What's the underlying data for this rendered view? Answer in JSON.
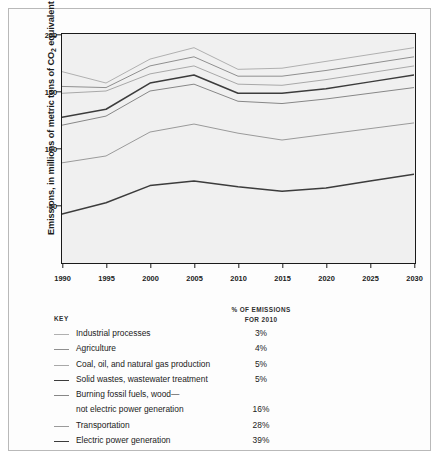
{
  "chart_data": {
    "type": "line",
    "title": "",
    "xlabel": "",
    "ylabel": "Emissions, in millions of metric tons of CO2 equivalent",
    "ylabel_prefix": "Emissions, in millions of metric tons of CO",
    "ylabel_sub": "2",
    "ylabel_suffix": " equivalent",
    "x": [
      1990,
      1995,
      2000,
      2005,
      2010,
      2015,
      2020,
      2025,
      2030
    ],
    "xticklabels": [
      "1990",
      "1995",
      "2000",
      "2005",
      "2010",
      "2015",
      "2020",
      "2025",
      "2030"
    ],
    "yticklabels": [
      "200",
      "150",
      "100",
      "50"
    ],
    "ytickvalues": [
      200,
      150,
      100,
      50
    ],
    "xlim": [
      1990,
      2030
    ],
    "ylim": [
      0,
      200
    ],
    "grid": false,
    "legend_position": "below",
    "note": "Cumulative stacked boundary lines; each series value is the running total including all sources below it.",
    "series": [
      {
        "name": "Electric power generation",
        "cumulative": [
          42,
          52,
          67,
          71,
          66,
          62,
          65,
          71,
          77
        ],
        "color": "#3c3c3c",
        "width": 1.5
      },
      {
        "name": "Transportation",
        "cumulative": [
          87,
          93,
          114,
          121,
          113,
          107,
          112,
          117,
          122
        ],
        "color": "#9a9a9a",
        "width": 1.0
      },
      {
        "name": "Burning fossil fuels, wood - not electric power generation",
        "cumulative": [
          120,
          128,
          150,
          156,
          141,
          139,
          143,
          148,
          153
        ],
        "color": "#878787",
        "width": 1.0
      },
      {
        "name": "Solid wastes, wastewater treatment",
        "cumulative": [
          127,
          134,
          157,
          164,
          148,
          148,
          152,
          158,
          164
        ],
        "color": "#3c3c3c",
        "width": 1.5
      },
      {
        "name": "Coal, oil, and natural gas production",
        "cumulative": [
          148,
          150,
          165,
          172,
          156,
          155,
          160,
          166,
          172
        ],
        "color": "#a8a8a8",
        "width": 1.0
      },
      {
        "name": "Agriculture",
        "cumulative": [
          154,
          153,
          172,
          180,
          163,
          163,
          168,
          174,
          180
        ],
        "color": "#8f8f8f",
        "width": 1.0
      },
      {
        "name": "Industrial processes",
        "cumulative": [
          167,
          157,
          178,
          188,
          169,
          170,
          176,
          182,
          188
        ],
        "color": "#b0b0b0",
        "width": 1.0
      }
    ]
  },
  "key": {
    "heading": "KEY",
    "pct_heading_line1": "% OF EMISSIONS",
    "pct_heading_line2": "FOR 2010",
    "rows": [
      {
        "label": "Industrial processes",
        "label2": "",
        "pct": "3%",
        "color": "#b0b0b0",
        "width": 1.0
      },
      {
        "label": "Agriculture",
        "label2": "",
        "pct": "4%",
        "color": "#8f8f8f",
        "width": 1.4
      },
      {
        "label": "Coal, oil, and natural gas production",
        "label2": "",
        "pct": "5%",
        "color": "#a8a8a8",
        "width": 1.0
      },
      {
        "label": "Solid wastes, wastewater treatment",
        "label2": "",
        "pct": "5%",
        "color": "#3c3c3c",
        "width": 1.8
      },
      {
        "label": "Burning fossil fuels, wood—",
        "label2": "not electric power generation",
        "pct": "16%",
        "color": "#878787",
        "width": 1.4
      },
      {
        "label": "Transportation",
        "label2": "",
        "pct": "28%",
        "color": "#9a9a9a",
        "width": 1.0
      },
      {
        "label": "Electric power generation",
        "label2": "",
        "pct": "39%",
        "color": "#3c3c3c",
        "width": 1.8
      }
    ]
  }
}
